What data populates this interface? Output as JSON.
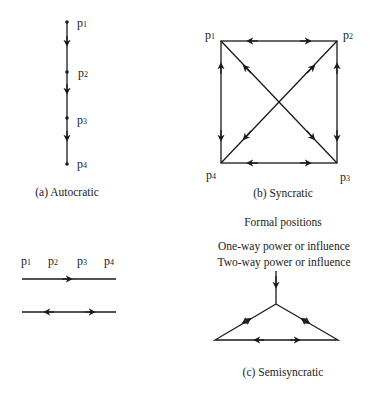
{
  "diagram": {
    "autocratic": {
      "caption": "(a) Autocratic",
      "nodes": [
        {
          "label": "p",
          "sub": "1"
        },
        {
          "label": "p",
          "sub": "2"
        },
        {
          "label": "p",
          "sub": "3"
        },
        {
          "label": "p",
          "sub": "4"
        }
      ],
      "edges": [
        {
          "from": "p1",
          "to": "p2",
          "type": "one-way"
        },
        {
          "from": "p2",
          "to": "p3",
          "type": "one-way"
        },
        {
          "from": "p3",
          "to": "p4",
          "type": "one-way"
        }
      ]
    },
    "syncratic": {
      "caption": "(b) Syncratic",
      "nodes": [
        {
          "label": "p",
          "sub": "1"
        },
        {
          "label": "p",
          "sub": "2"
        },
        {
          "label": "p",
          "sub": "3"
        },
        {
          "label": "p",
          "sub": "4"
        }
      ],
      "edges": [
        {
          "from": "p1",
          "to": "p2",
          "type": "two-way"
        },
        {
          "from": "p2",
          "to": "p3",
          "type": "two-way"
        },
        {
          "from": "p3",
          "to": "p4",
          "type": "two-way"
        },
        {
          "from": "p4",
          "to": "p1",
          "type": "two-way"
        },
        {
          "from": "p1",
          "to": "p3",
          "type": "two-way"
        },
        {
          "from": "p2",
          "to": "p4",
          "type": "two-way"
        }
      ]
    },
    "legend": {
      "title": "Formal positions",
      "positions": [
        {
          "label": "p",
          "sub": "1"
        },
        {
          "label": "p",
          "sub": "2"
        },
        {
          "label": "p",
          "sub": "3"
        },
        {
          "label": "p",
          "sub": "4"
        }
      ],
      "one_way": "One-way power or influence",
      "two_way": "Two-way power or influence"
    },
    "semisyncratic": {
      "caption": "(c) Semisyncratic",
      "edges": [
        {
          "from": "top",
          "to": "apex",
          "type": "one-way"
        },
        {
          "from": "apex",
          "to": "left",
          "type": "two-way"
        },
        {
          "from": "apex",
          "to": "right",
          "type": "two-way"
        },
        {
          "from": "left",
          "to": "right",
          "type": "two-way"
        }
      ]
    }
  }
}
